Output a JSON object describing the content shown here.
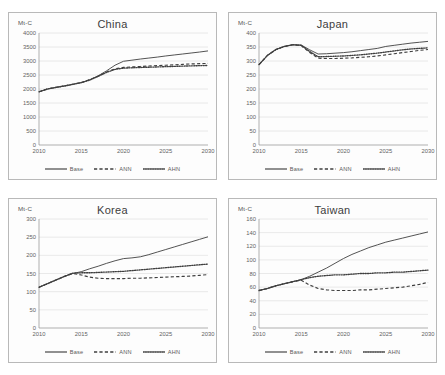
{
  "figure": {
    "panel_count": 4,
    "y_axis_label": "Mt-C",
    "legend": [
      {
        "label": "Base",
        "style": "solid"
      },
      {
        "label": "ANN",
        "style": "dashed"
      },
      {
        "label": "AHN",
        "style": "dotted"
      }
    ],
    "line_color": "#3f3f3f"
  },
  "chart_data": [
    {
      "type": "line",
      "title": "China",
      "xlabel": "",
      "ylabel": "Mt-C",
      "grid": true,
      "legend_position": "bottom",
      "xlim": [
        2010,
        2030
      ],
      "ylim": [
        0,
        4000
      ],
      "yticks": [
        0,
        500,
        1000,
        1500,
        2000,
        2500,
        3000,
        3500,
        4000
      ],
      "xticks": [
        2010,
        2015,
        2020,
        2025,
        2030
      ],
      "x": [
        2010,
        2011,
        2012,
        2013,
        2014,
        2015,
        2016,
        2017,
        2018,
        2019,
        2020,
        2021,
        2022,
        2023,
        2024,
        2025,
        2026,
        2027,
        2028,
        2029,
        2030
      ],
      "series": [
        {
          "name": "Base",
          "style": "solid",
          "values": [
            1900,
            2000,
            2060,
            2110,
            2170,
            2230,
            2330,
            2470,
            2650,
            2850,
            2990,
            3030,
            3070,
            3105,
            3140,
            3180,
            3215,
            3250,
            3285,
            3320,
            3360
          ]
        },
        {
          "name": "ANN",
          "style": "dashed",
          "values": [
            1900,
            2000,
            2060,
            2110,
            2170,
            2230,
            2330,
            2460,
            2610,
            2720,
            2770,
            2790,
            2805,
            2820,
            2835,
            2850,
            2865,
            2880,
            2895,
            2905,
            2915
          ]
        },
        {
          "name": "AHN",
          "style": "dotted",
          "values": [
            1900,
            2000,
            2055,
            2105,
            2165,
            2225,
            2320,
            2450,
            2595,
            2700,
            2745,
            2758,
            2768,
            2778,
            2788,
            2798,
            2808,
            2818,
            2826,
            2834,
            2840
          ]
        }
      ]
    },
    {
      "type": "line",
      "title": "Japan",
      "xlabel": "",
      "ylabel": "Mt-C",
      "grid": true,
      "legend_position": "bottom",
      "xlim": [
        2010,
        2030
      ],
      "ylim": [
        0,
        400
      ],
      "yticks": [
        0,
        50,
        100,
        150,
        200,
        250,
        300,
        350,
        400
      ],
      "xticks": [
        2010,
        2015,
        2020,
        2025,
        2030
      ],
      "x": [
        2010,
        2011,
        2012,
        2013,
        2014,
        2015,
        2016,
        2017,
        2018,
        2019,
        2020,
        2021,
        2022,
        2023,
        2024,
        2025,
        2026,
        2027,
        2028,
        2029,
        2030
      ],
      "series": [
        {
          "name": "Base",
          "style": "solid",
          "values": [
            287,
            320,
            341,
            352,
            358,
            357,
            340,
            325,
            326,
            328,
            330,
            333,
            337,
            341,
            345,
            352,
            356,
            360,
            364,
            367,
            370
          ]
        },
        {
          "name": "ANN",
          "style": "dashed",
          "values": [
            287,
            320,
            341,
            352,
            358,
            355,
            330,
            310,
            309,
            309,
            310,
            311,
            313,
            315,
            318,
            322,
            326,
            330,
            334,
            338,
            341
          ]
        },
        {
          "name": "AHN",
          "style": "dotted",
          "values": [
            287,
            320,
            341,
            352,
            358,
            356,
            334,
            315,
            316,
            317,
            318,
            320,
            322,
            325,
            328,
            332,
            336,
            340,
            343,
            345,
            347
          ]
        }
      ]
    },
    {
      "type": "line",
      "title": "Korea",
      "xlabel": "",
      "ylabel": "Mt-C",
      "grid": true,
      "legend_position": "bottom",
      "xlim": [
        2010,
        2030
      ],
      "ylim": [
        0,
        300
      ],
      "yticks": [
        0,
        50,
        100,
        150,
        200,
        250,
        300
      ],
      "xticks": [
        2010,
        2015,
        2020,
        2025,
        2030
      ],
      "x": [
        2010,
        2011,
        2012,
        2013,
        2014,
        2015,
        2016,
        2017,
        2018,
        2019,
        2020,
        2021,
        2022,
        2023,
        2024,
        2025,
        2026,
        2027,
        2028,
        2029,
        2030
      ],
      "series": [
        {
          "name": "Base",
          "style": "solid",
          "values": [
            112,
            122,
            132,
            142,
            150,
            155,
            163,
            170,
            178,
            185,
            191,
            193,
            196,
            202,
            209,
            216,
            223,
            230,
            237,
            244,
            251
          ]
        },
        {
          "name": "ANN",
          "style": "dashed",
          "values": [
            112,
            122,
            132,
            142,
            150,
            146,
            140,
            137,
            136,
            136,
            136,
            137,
            137,
            138,
            139,
            140,
            141,
            142,
            143,
            145,
            147
          ]
        },
        {
          "name": "AHN",
          "style": "dotted",
          "values": [
            112,
            122,
            132,
            142,
            151,
            152,
            152,
            153,
            154,
            155,
            156,
            158,
            160,
            162,
            164,
            166,
            168,
            170,
            172,
            174,
            176
          ]
        }
      ]
    },
    {
      "type": "line",
      "title": "Taiwan",
      "xlabel": "",
      "ylabel": "Mt-C",
      "grid": true,
      "legend_position": "bottom",
      "xlim": [
        2010,
        2030
      ],
      "ylim": [
        0,
        160
      ],
      "yticks": [
        0,
        20,
        40,
        60,
        80,
        100,
        120,
        140,
        160
      ],
      "xticks": [
        2010,
        2015,
        2020,
        2025,
        2030
      ],
      "x": [
        2010,
        2011,
        2012,
        2013,
        2014,
        2015,
        2016,
        2017,
        2018,
        2019,
        2020,
        2021,
        2022,
        2023,
        2024,
        2025,
        2026,
        2027,
        2028,
        2029,
        2030
      ],
      "series": [
        {
          "name": "Base",
          "style": "solid",
          "values": [
            55,
            58,
            62,
            65,
            68,
            71,
            76,
            82,
            88,
            95,
            102,
            108,
            113,
            118,
            122,
            126,
            129,
            132,
            135,
            138,
            141
          ]
        },
        {
          "name": "ANN",
          "style": "dashed",
          "values": [
            55,
            58,
            62,
            65,
            68,
            70,
            63,
            58,
            56,
            55,
            55,
            55,
            56,
            56,
            57,
            58,
            59,
            60,
            62,
            64,
            67
          ]
        },
        {
          "name": "AHN",
          "style": "dotted",
          "values": [
            55,
            58,
            62,
            65,
            68,
            71,
            74,
            76,
            77,
            78,
            78,
            79,
            80,
            80,
            81,
            81,
            82,
            82,
            83,
            84,
            85
          ]
        }
      ]
    }
  ]
}
